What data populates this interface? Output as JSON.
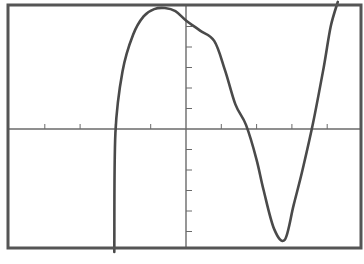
{
  "chart_data": {
    "type": "line",
    "title": "",
    "xlabel": "",
    "ylabel": "",
    "grid": false,
    "legend": null,
    "x_tick_spacing": 1,
    "y_tick_spacing": 1,
    "xlim": [
      -5.1,
      5.0
    ],
    "ylim": [
      -6.0,
      6.2
    ],
    "series": [
      {
        "name": "f(x)",
        "x": [
          -2.03,
          -2.0,
          -1.8,
          -1.5,
          -1.2,
          -0.9,
          -0.6,
          -0.3,
          0.0,
          0.4,
          0.8,
          1.1,
          1.4,
          1.7,
          2.0,
          2.2,
          2.5,
          2.8,
          3.05,
          3.3,
          3.6,
          3.9,
          4.1,
          4.3
        ],
        "y": [
          -6.0,
          -0.2,
          2.8,
          4.6,
          5.5,
          5.85,
          5.9,
          5.75,
          5.3,
          4.8,
          4.3,
          2.9,
          1.2,
          0.2,
          -1.5,
          -3.0,
          -4.9,
          -5.4,
          -3.7,
          -2.0,
          0.3,
          3.0,
          5.0,
          6.2
        ]
      }
    ],
    "x_intercepts_approx": [
      -2.0,
      2.2,
      3.9
    ],
    "local_max_approx": {
      "x": -0.6,
      "y": 5.9
    },
    "local_min_approx": {
      "x": 3.05,
      "y": -3.7
    },
    "annotations": []
  },
  "plot": {
    "frame_color": "#555555",
    "curve_color": "#4a4a4a",
    "axis_color": "#6a6a6a",
    "background": "#ffffff"
  }
}
